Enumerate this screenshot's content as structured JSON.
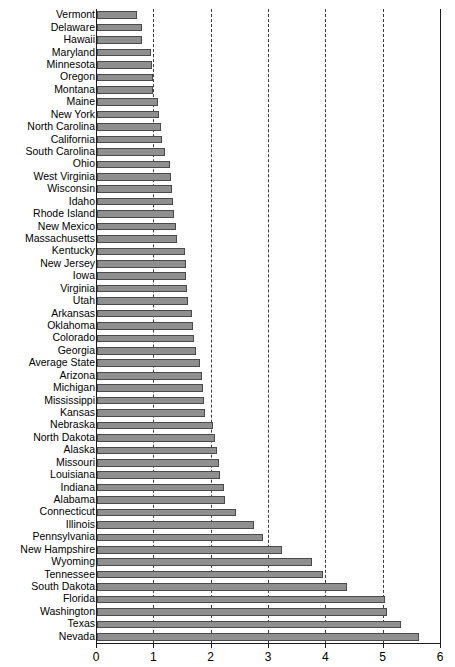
{
  "chart_data": {
    "type": "bar",
    "orientation": "horizontal",
    "title": "",
    "xlabel": "",
    "ylabel": "",
    "xlim": [
      0,
      6
    ],
    "xticks": [
      0,
      1,
      2,
      3,
      4,
      5,
      6
    ],
    "xtick_labels": [
      "0",
      "1",
      "2",
      "3",
      "4",
      "5",
      "6"
    ],
    "grid": true,
    "grid_style": "dashed vertical",
    "legend": null,
    "bar_color": "#8f8f8f",
    "bar_edge_color": "#4a4a4a",
    "categories": [
      "Vermont",
      "Delaware",
      "Hawaii",
      "Maryland",
      "Minnesota",
      "Oregon",
      "Montana",
      "Maine",
      "New York",
      "North Carolina",
      "California",
      "South Carolina",
      "Ohio",
      "West Virginia",
      "Wisconsin",
      "Idaho",
      "Rhode Island",
      "New Mexico",
      "Massachusetts",
      "Kentucky",
      "New Jersey",
      "Iowa",
      "Virginia",
      "Utah",
      "Arkansas",
      "Oklahoma",
      "Colorado",
      "Georgia",
      "Average State",
      "Arizona",
      "Michigan",
      "Mississippi",
      "Kansas",
      "Nebraska",
      "North Dakota",
      "Alaska",
      "Missouri",
      "Louisiana",
      "Indiana",
      "Alabama",
      "Connecticut",
      "Illinois",
      "Pennsylvania",
      "New Hampshire",
      "Wyoming",
      "Tennessee",
      "South Dakota",
      "Florida",
      "Washington",
      "Texas",
      "Nevada"
    ],
    "values": [
      0.7,
      0.78,
      0.79,
      0.95,
      0.96,
      0.97,
      0.98,
      1.07,
      1.08,
      1.11,
      1.13,
      1.18,
      1.28,
      1.29,
      1.3,
      1.33,
      1.35,
      1.37,
      1.39,
      1.53,
      1.55,
      1.56,
      1.57,
      1.59,
      1.66,
      1.68,
      1.7,
      1.72,
      1.8,
      1.83,
      1.85,
      1.86,
      1.88,
      2.03,
      2.05,
      2.1,
      2.13,
      2.15,
      2.21,
      2.23,
      2.42,
      2.73,
      2.9,
      3.22,
      3.75,
      3.95,
      4.36,
      5.03,
      5.06,
      5.3,
      5.62
    ]
  }
}
